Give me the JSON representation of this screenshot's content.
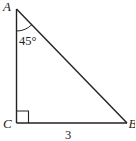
{
  "diagram": {
    "type": "right-triangle",
    "vertices": {
      "A": {
        "label": "A"
      },
      "C": {
        "label": "C"
      },
      "B": {
        "label": "B"
      }
    },
    "angle_A_label": "45°",
    "right_angle_at": "C",
    "side_CB_label": "3",
    "stroke_color": "#222222"
  }
}
